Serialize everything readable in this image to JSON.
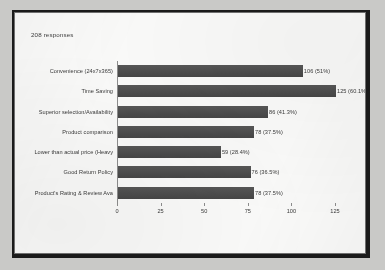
{
  "caption": "208 responses",
  "chart_data": {
    "type": "bar",
    "orientation": "horizontal",
    "title": "",
    "subtitle": "208 responses",
    "xlabel": "",
    "ylabel": "",
    "xlim": [
      0,
      125
    ],
    "grid": false,
    "legend": false,
    "total_responses": 208,
    "bar_color": "#4a4a4a",
    "categories": [
      "Convenience (24x7x365)",
      "Time Saving",
      "Superior selection/Availability",
      "Product comparison",
      "Lower than actual price (Heavy",
      "Good Return Policy",
      "Product's Rating & Review Ava"
    ],
    "values": [
      106,
      125,
      86,
      78,
      59,
      76,
      78
    ],
    "percents": [
      "51%",
      "60.1%",
      "41.3%",
      "37.5%",
      "28.4%",
      "36.5%",
      "37.5%"
    ],
    "data_labels": [
      "106 (51%)",
      "125 (60.1%)",
      "86 (41.3%)",
      "78 (37.5%)",
      "59 (28.4%)",
      "76 (36.5%)",
      "78 (37.5%)"
    ],
    "xticks": [
      0,
      25,
      50,
      75,
      100,
      125
    ],
    "xtick_labels": [
      "0",
      "25",
      "50",
      "75",
      "100",
      "125"
    ]
  }
}
